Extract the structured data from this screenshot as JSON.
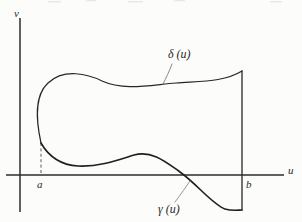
{
  "figure": {
    "kind": "math-diagram",
    "background_color": "#fcfcfb",
    "ink_color": "#262626"
  },
  "axes": {
    "vertical": {
      "name": "v-axis",
      "label": "v",
      "x": 20,
      "y_top": 18,
      "y_bottom": 212
    },
    "horizontal": {
      "name": "u-axis",
      "label": "u",
      "y": 175,
      "x_left": 6,
      "x_right": 284
    }
  },
  "ticks": [
    {
      "label": "a",
      "x": 41,
      "name": "tick-a"
    },
    {
      "label": "b",
      "x": 242,
      "name": "tick-b"
    }
  ],
  "curves": [
    {
      "name": "delta-curve",
      "label": "δ (u)",
      "role": "upper-boundary",
      "path": "M 41,143 C 36,120 34,96 48,83 C 64,68 88,74 102,81 C 124,91 150,85 176,83 C 202,81 224,82 242,71",
      "stroke_width": 1.2
    },
    {
      "name": "gamma-curve",
      "label": "γ (u)",
      "role": "lower-boundary",
      "path": "M 41,143 C 49,157 60,165 78,166 C 100,167 118,160 134,155 C 152,150 166,162 180,172 C 198,185 212,204 225,209 C 232,211 238,210 242,210",
      "stroke_width": 1.6
    },
    {
      "name": "right-boundary-segment",
      "label": "",
      "role": "right-edge",
      "path": "M 242,71 L 242,210",
      "stroke_width": 1.3
    }
  ],
  "guides": [
    {
      "name": "dashed-drop-line-a",
      "from": [
        41,
        143
      ],
      "to": [
        41,
        175
      ],
      "style": "dashed"
    }
  ],
  "leaders": [
    {
      "name": "delta-leader-line",
      "from": [
        172,
        64
      ],
      "to": [
        163,
        84
      ]
    },
    {
      "name": "gamma-leader-line",
      "from": [
        175,
        202
      ],
      "to": [
        190,
        181
      ]
    }
  ],
  "labels": {
    "v_axis": "v",
    "u_axis": "u",
    "tick_a": "a",
    "tick_b": "b",
    "delta": "δ (u)",
    "gamma": "γ (u)"
  }
}
